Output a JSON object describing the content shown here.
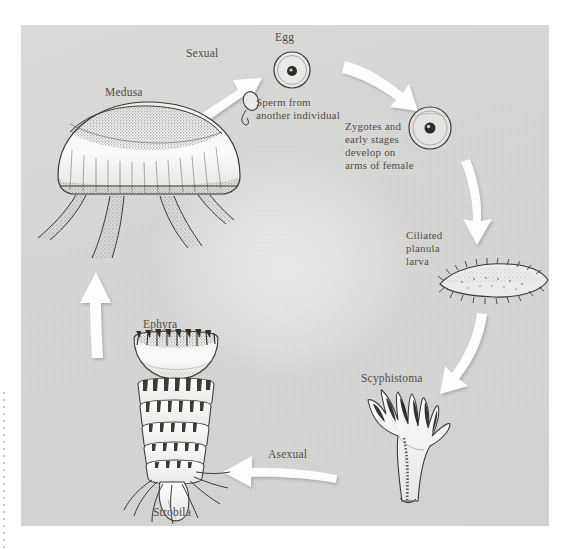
{
  "figure": {
    "background_color": "#d6d6d4",
    "panel_color": "#dcdcda",
    "arrow_color": "#ffffff",
    "ink_color": "#3a3734",
    "label_color": "#4e4a46"
  },
  "labels": {
    "medusa": "Medusa",
    "sexual": "Sexual",
    "egg": "Egg",
    "sperm": "Sperm from\nanother individual",
    "zygotes": "Zygotes and\nearly stages\ndevelop on\narms of female",
    "planula": "Ciliated\nplanula\nlarva",
    "scyphistoma": "Scyphistoma",
    "asexual": "Asexual",
    "strobila": "Strobila",
    "ephyra": "Ephyra"
  },
  "stages": [
    {
      "id": "medusa",
      "name": "Medusa",
      "label": "Medusa",
      "phase": "sexual",
      "order": 1
    },
    {
      "id": "egg",
      "name": "Egg",
      "label": "Egg",
      "phase": "sexual",
      "order": 2
    },
    {
      "id": "sperm",
      "name": "Sperm",
      "label": "Sperm from another individual",
      "phase": "sexual",
      "order": 3
    },
    {
      "id": "zygote",
      "name": "Zygote",
      "label": "Zygotes and early stages develop on arms of female",
      "phase": "sexual",
      "order": 4
    },
    {
      "id": "planula",
      "name": "Planula",
      "label": "Ciliated planula larva",
      "phase": "larval",
      "order": 5
    },
    {
      "id": "scyphistoma",
      "name": "Scyphistoma",
      "label": "Scyphistoma",
      "phase": "asexual",
      "order": 6
    },
    {
      "id": "strobila",
      "name": "Strobila",
      "label": "Strobila",
      "phase": "asexual",
      "order": 7
    },
    {
      "id": "ephyra",
      "name": "Ephyra",
      "label": "Ephyra",
      "phase": "asexual",
      "order": 8
    }
  ],
  "arrows": [
    {
      "id": "medusa-to-egg",
      "from": "medusa",
      "to": "egg",
      "label": "Sexual",
      "direction": "up-right"
    },
    {
      "id": "egg-to-zygote",
      "from": "egg",
      "to": "zygote",
      "label": "",
      "direction": "down-right"
    },
    {
      "id": "zygote-to-planula",
      "from": "zygote",
      "to": "planula",
      "label": "",
      "direction": "down"
    },
    {
      "id": "planula-to-scyphistoma",
      "from": "planula",
      "to": "scyphistoma",
      "label": "",
      "direction": "down-left"
    },
    {
      "id": "scyphistoma-to-strobila",
      "from": "scyphistoma",
      "to": "strobila",
      "label": "Asexual",
      "direction": "left"
    },
    {
      "id": "ephyra-to-medusa",
      "from": "ephyra",
      "to": "medusa",
      "label": "",
      "direction": "up"
    }
  ]
}
